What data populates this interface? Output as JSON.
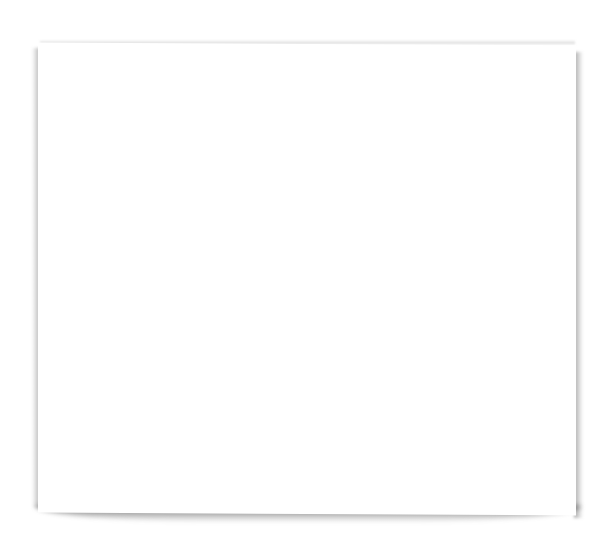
{
  "canvas": {
    "background": "#ffffff"
  },
  "paper": {
    "fill": "#ffffff",
    "shadow_color": "#555555",
    "content": ""
  }
}
